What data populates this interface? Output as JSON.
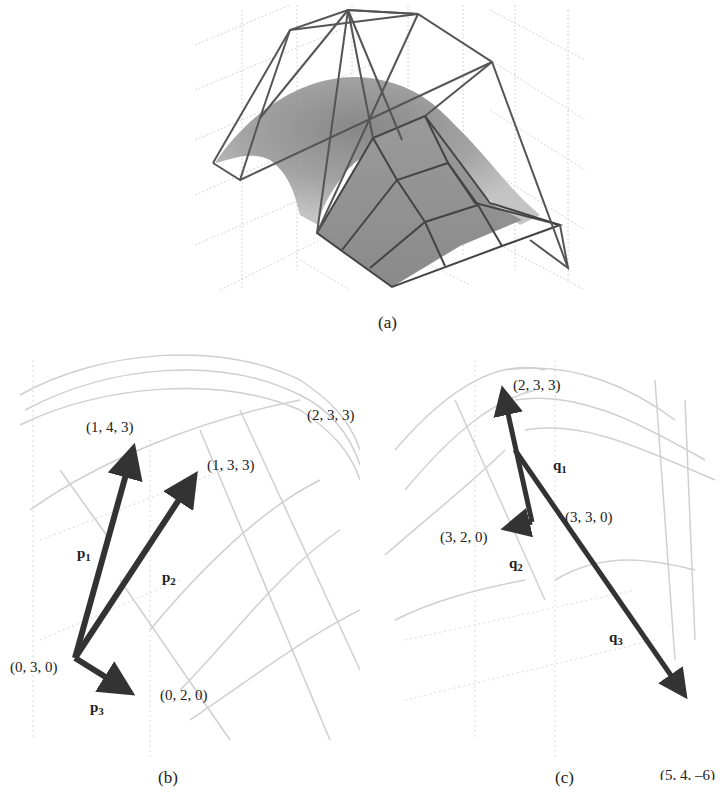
{
  "figure": {
    "panel_a": {
      "caption": "(a)",
      "description": "Bezier surface patch with its control net (wireframe) over a shaded surface"
    },
    "panel_b": {
      "caption": "(b)",
      "origin_label": "(0, 3, 0)",
      "points": [
        {
          "label": "(1, 4, 3)"
        },
        {
          "label": "(1, 3, 3)"
        },
        {
          "label": "(0, 2, 0)"
        },
        {
          "label": "(2, 3, 3)"
        }
      ],
      "vectors": [
        {
          "name": "p",
          "sub": "1"
        },
        {
          "name": "p",
          "sub": "2"
        },
        {
          "name": "p",
          "sub": "3"
        }
      ]
    },
    "panel_c": {
      "caption": "(c)",
      "origin_label": "(3, 3, 0)",
      "points": [
        {
          "label": "(2, 3, 3)"
        },
        {
          "label": "(3, 2, 0)"
        },
        {
          "label": "(5, 4, –6)"
        }
      ],
      "vectors": [
        {
          "name": "q",
          "sub": "1"
        },
        {
          "name": "q",
          "sub": "2"
        },
        {
          "name": "q",
          "sub": "3"
        }
      ]
    }
  },
  "colors": {
    "arrow": "#333333",
    "grid": "#c8c8c8",
    "net": "#555555",
    "surface": "#8a8a8a"
  }
}
